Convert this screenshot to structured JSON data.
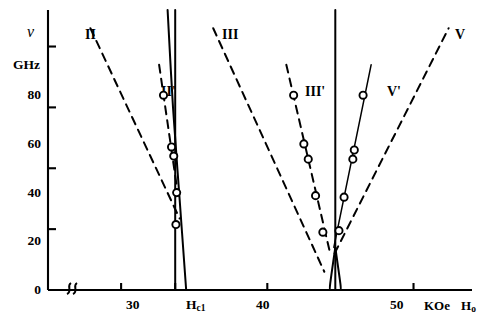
{
  "chart_data": {
    "type": "line",
    "title": "",
    "xlabel": "Ho",
    "xunit": "KOe",
    "ylabel": "ν",
    "yunit": "GHz",
    "xlim": [
      25,
      54
    ],
    "ylim": [
      0,
      92
    ],
    "grid": false,
    "legend": "inline-curve-labels",
    "axis_break": true,
    "y_ticks": [
      {
        "value": 0,
        "label": "0"
      },
      {
        "value": 20,
        "label": "20"
      },
      {
        "value": 40,
        "label": "40"
      },
      {
        "value": 60,
        "label": "60"
      },
      {
        "value": 80,
        "label": "80"
      }
    ],
    "x_ticks": [
      {
        "value": 30,
        "label": "30"
      },
      {
        "value": 33.7,
        "label": "Hc1"
      },
      {
        "value": 40,
        "label": "40"
      },
      {
        "value": 50,
        "label": "50"
      }
    ],
    "x_special_ticks": [
      {
        "value": 33.7,
        "label": "Hc1",
        "base": "H",
        "sub": "c1"
      }
    ],
    "annotations": [
      {
        "text": "II",
        "x": 28.4,
        "y": 89.0
      },
      {
        "text": "II'",
        "x": 33.0,
        "y": 78.0
      },
      {
        "text": "III",
        "x": 36.4,
        "y": 89.0
      },
      {
        "text": "III'",
        "x": 41.5,
        "y": 78.0
      },
      {
        "text": "V'",
        "x": 48.3,
        "y": 78.0
      },
      {
        "text": "V",
        "x": 52.6,
        "y": 89.0
      }
    ],
    "series": [
      {
        "name": "II",
        "style": "dashed",
        "points": [
          [
            27.9,
            86.0
          ],
          [
            34.0,
            23.5
          ]
        ]
      },
      {
        "name": "II'",
        "style": "dashed",
        "markers": "open-circle",
        "points": [
          [
            32.6,
            74.0
          ],
          [
            33.9,
            31.0
          ]
        ],
        "data_points": [
          [
            32.9,
            64.0
          ],
          [
            33.45,
            47.0
          ],
          [
            33.6,
            44.0
          ],
          [
            33.8,
            32.0
          ],
          [
            33.75,
            21.5
          ]
        ]
      },
      {
        "name": "Hc1-vertical",
        "style": "solid",
        "points": [
          [
            33.7,
            92.0
          ],
          [
            33.7,
            0.0
          ]
        ]
      },
      {
        "name": "Hc1-branch",
        "style": "solid",
        "points": [
          [
            33.18,
            92.0
          ],
          [
            33.55,
            60.0
          ],
          [
            34.0,
            30.0
          ],
          [
            34.45,
            0.0
          ]
        ]
      },
      {
        "name": "III",
        "style": "dashed",
        "points": [
          [
            36.3,
            86.0
          ],
          [
            43.9,
            6.0
          ]
        ]
      },
      {
        "name": "III'",
        "style": "dashed",
        "markers": "open-circle",
        "points": [
          [
            41.3,
            74.0
          ],
          [
            44.3,
            12.0
          ]
        ],
        "data_points": [
          [
            41.8,
            64.0
          ],
          [
            42.5,
            48.0
          ],
          [
            42.8,
            43.0
          ],
          [
            43.3,
            31.0
          ],
          [
            43.8,
            19.0
          ]
        ]
      },
      {
        "name": "center-vertical",
        "style": "solid",
        "points": [
          [
            44.65,
            92.0
          ],
          [
            44.65,
            0.0
          ]
        ]
      },
      {
        "name": "center-fork-left",
        "style": "solid",
        "points": [
          [
            44.65,
            14.0
          ],
          [
            44.3,
            2.0
          ],
          [
            44.3,
            0.0
          ]
        ]
      },
      {
        "name": "center-fork-right",
        "style": "solid",
        "points": [
          [
            44.65,
            14.0
          ],
          [
            45.0,
            2.0
          ],
          [
            45.0,
            0.0
          ]
        ]
      },
      {
        "name": "V'",
        "style": "solid-thin",
        "markers": "open-circle",
        "points": [
          [
            44.55,
            14.0
          ],
          [
            47.1,
            74.0
          ]
        ],
        "data_points": [
          [
            44.9,
            19.5
          ],
          [
            45.25,
            30.5
          ],
          [
            45.85,
            43.0
          ],
          [
            45.95,
            46.0
          ],
          [
            46.55,
            64.0
          ]
        ]
      },
      {
        "name": "V",
        "style": "dashed",
        "points": [
          [
            44.6,
            12.0
          ],
          [
            52.4,
            86.0
          ]
        ]
      }
    ]
  },
  "axes": {
    "y_axis_name": "ν",
    "y_axis_unit": "GHz",
    "x_axis_unit": "KOe",
    "x_axis_name_base": "H",
    "x_axis_name_sub": "o"
  },
  "colors": {
    "line": "#000000",
    "background": "#ffffff",
    "marker_stroke": "#000000",
    "marker_fill": "#ffffff"
  }
}
